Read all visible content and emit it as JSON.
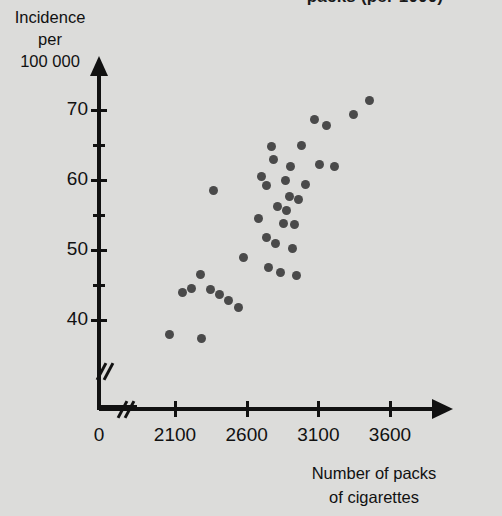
{
  "figure": {
    "top_title": "packs (per 1000)",
    "y_axis_title_lines": [
      "Incidence",
      "per",
      "100 000"
    ],
    "x_axis_title_lines": [
      "Number of packs",
      "of cigarettes"
    ]
  },
  "chart_data": {
    "type": "scatter",
    "title": "packs (per 1000)",
    "xlabel": "Number of packs of cigarettes",
    "ylabel": "Incidence per 100 000",
    "xlim": [
      1750,
      3850
    ],
    "ylim": [
      36,
      73
    ],
    "grid": false,
    "legend": null,
    "x_ticks": [
      0,
      2100,
      2600,
      3100,
      3600
    ],
    "x_tick_labels": [
      "0",
      "2100",
      "2600",
      "3100",
      "3600"
    ],
    "y_ticks": [
      40,
      50,
      60,
      70
    ],
    "y_tick_labels": [
      "40",
      "50",
      "60",
      "70"
    ],
    "y_minor_ticks": [
      45,
      55,
      65
    ],
    "axis_break_x": true,
    "axis_break_y": true,
    "marker_color": "#4a4a4a",
    "background_color": "#dcdcda",
    "axis_color": "#111111",
    "points": [
      {
        "x": 2065,
        "y": 38.0
      },
      {
        "x": 2150,
        "y": 44.0
      },
      {
        "x": 2215,
        "y": 44.5
      },
      {
        "x": 2280,
        "y": 46.5
      },
      {
        "x": 2285,
        "y": 37.3
      },
      {
        "x": 2345,
        "y": 44.3
      },
      {
        "x": 2370,
        "y": 58.5
      },
      {
        "x": 2410,
        "y": 43.6
      },
      {
        "x": 2470,
        "y": 42.8
      },
      {
        "x": 2545,
        "y": 41.8
      },
      {
        "x": 2575,
        "y": 49.0
      },
      {
        "x": 2680,
        "y": 54.5
      },
      {
        "x": 2700,
        "y": 60.5
      },
      {
        "x": 2735,
        "y": 59.2
      },
      {
        "x": 2740,
        "y": 51.8
      },
      {
        "x": 2755,
        "y": 47.5
      },
      {
        "x": 2770,
        "y": 64.8
      },
      {
        "x": 2790,
        "y": 63.0
      },
      {
        "x": 2800,
        "y": 51.0
      },
      {
        "x": 2815,
        "y": 56.2
      },
      {
        "x": 2835,
        "y": 46.8
      },
      {
        "x": 2855,
        "y": 53.8
      },
      {
        "x": 2870,
        "y": 59.9
      },
      {
        "x": 2880,
        "y": 55.7
      },
      {
        "x": 2900,
        "y": 57.6
      },
      {
        "x": 2905,
        "y": 62.0
      },
      {
        "x": 2920,
        "y": 50.2
      },
      {
        "x": 2935,
        "y": 53.6
      },
      {
        "x": 2945,
        "y": 46.3
      },
      {
        "x": 2960,
        "y": 57.2
      },
      {
        "x": 2985,
        "y": 65.0
      },
      {
        "x": 3010,
        "y": 59.4
      },
      {
        "x": 3075,
        "y": 68.7
      },
      {
        "x": 3110,
        "y": 62.2
      },
      {
        "x": 3160,
        "y": 67.8
      },
      {
        "x": 3215,
        "y": 62.0
      },
      {
        "x": 3345,
        "y": 69.3
      },
      {
        "x": 3460,
        "y": 71.3
      }
    ]
  }
}
